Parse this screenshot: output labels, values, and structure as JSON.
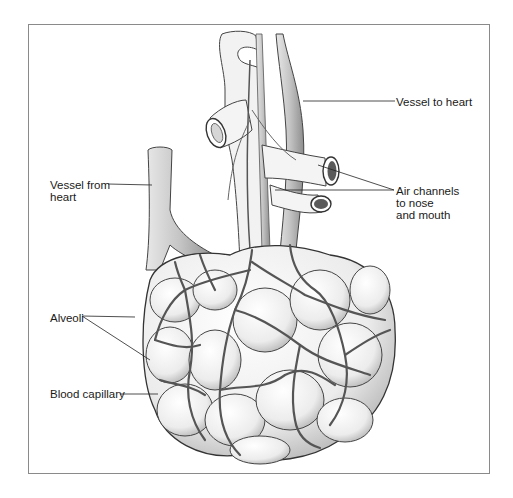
{
  "figure": {
    "labels": {
      "vessel_to_heart": "Vessel to heart",
      "air_channels_line1": "Air channels",
      "air_channels_line2": "to nose",
      "air_channels_line3": "and mouth",
      "vessel_from_heart_line1": "Vessel from",
      "vessel_from_heart_line2": "heart",
      "alveoli": "Alveoli",
      "blood_capillary": "Blood capillary"
    },
    "colors": {
      "line": "#333333",
      "frame": "#8a8a8a",
      "shading": "#9a9a9a",
      "background": "#ffffff"
    }
  }
}
